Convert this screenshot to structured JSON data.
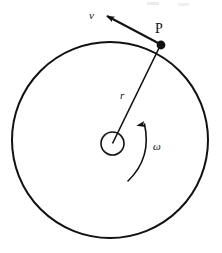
{
  "figure": {
    "title_text": "",
    "domain": "physics-diagram",
    "background_color": "#ffffff",
    "stroke_color": "#111111"
  },
  "labels": {
    "velocity": "v",
    "point": "P",
    "radius": "r",
    "angular_velocity": "ω"
  },
  "geometry": {
    "main_circle": {
      "cx": 110,
      "cy": 140,
      "r": 98,
      "stroke_width": 2.0
    },
    "hub_circle": {
      "cx": 112.5,
      "cy": 143.5,
      "r": 11.5,
      "stroke_width": 1.6
    },
    "point_p": {
      "cx": 161,
      "cy": 45,
      "r": 4.4
    },
    "radius_line": {
      "x1": 112.5,
      "y1": 143.5,
      "x2": 160,
      "y2": 46,
      "stroke_width": 1.6
    },
    "velocity_vector": {
      "x1": 160,
      "y1": 44,
      "x2": 107,
      "y2": 16,
      "stroke_width": 2.0
    },
    "omega_arc": {
      "start_x": 128,
      "start_y": 181,
      "end_x": 144.5,
      "end_y": 124,
      "ctrl_x": 152,
      "ctrl_y": 158,
      "stroke_width": 1.6
    }
  },
  "label_positions": {
    "velocity": {
      "x": 89,
      "y": 19,
      "size": 11
    },
    "point": {
      "x": 155,
      "y": 33,
      "size": 14
    },
    "radius": {
      "x": 120,
      "y": 99,
      "size": 11
    },
    "angular_velocity": {
      "x": 153,
      "y": 150,
      "size": 11
    }
  },
  "artifacts": [
    {
      "x": 147,
      "y": 2,
      "w": 12,
      "h": 3,
      "color": "#ececec"
    },
    {
      "x": 178,
      "y": 3,
      "w": 11,
      "h": 3,
      "color": "#efefef"
    }
  ]
}
